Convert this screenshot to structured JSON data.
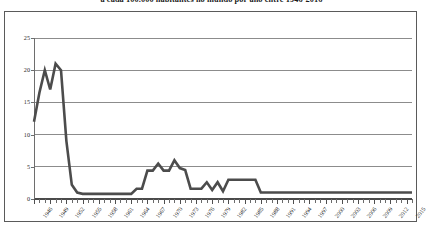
{
  "chart_data": {
    "type": "line",
    "title": "a cada 100.000 habitantes no mundo por ano entre 1946-2016",
    "xlabel": "",
    "ylabel": "",
    "ylim": [
      0,
      25
    ],
    "xlim": [
      1946,
      2016
    ],
    "yticks": [
      0,
      5,
      10,
      15,
      20,
      25
    ],
    "grid": true,
    "legend": false,
    "tick_label_step": 3,
    "xtick_labels": [
      "1946",
      "1949",
      "1952",
      "1955",
      "1958",
      "1961",
      "1964",
      "1967",
      "1970",
      "1973",
      "1976",
      "1979",
      "1982",
      "1985",
      "1988",
      "1991",
      "1994",
      "1997",
      "2000",
      "2003",
      "2006",
      "2009",
      "2012",
      "2015"
    ],
    "line_color": "#4c4c4c",
    "grid_color": "#8c8c8c",
    "x": [
      1946,
      1947,
      1948,
      1949,
      1950,
      1951,
      1952,
      1953,
      1954,
      1955,
      1956,
      1957,
      1958,
      1959,
      1960,
      1961,
      1962,
      1963,
      1964,
      1965,
      1966,
      1967,
      1968,
      1969,
      1970,
      1971,
      1972,
      1973,
      1974,
      1975,
      1976,
      1977,
      1978,
      1979,
      1980,
      1981,
      1982,
      1983,
      1984,
      1985,
      1986,
      1987,
      1988,
      1989,
      1990,
      1991,
      1992,
      1993,
      1994,
      1995,
      1996,
      1997,
      1998,
      1999,
      2000,
      2001,
      2002,
      2003,
      2004,
      2005,
      2006,
      2007,
      2008,
      2009,
      2010,
      2011,
      2012,
      2013,
      2014,
      2015,
      2016
    ],
    "values": [
      12.0,
      16.5,
      20.0,
      17.0,
      21.0,
      20.0,
      9.0,
      2.2,
      1.0,
      0.8,
      0.8,
      0.8,
      0.8,
      0.8,
      0.8,
      0.8,
      0.8,
      0.8,
      0.8,
      1.6,
      1.6,
      4.4,
      4.4,
      5.5,
      4.4,
      4.4,
      6.0,
      4.8,
      4.5,
      1.6,
      1.6,
      1.6,
      2.6,
      1.4,
      2.6,
      1.2,
      3.0,
      3.0,
      3.0,
      3.0,
      3.0,
      3.0,
      1.0,
      1.0,
      1.0,
      1.0,
      1.0,
      1.0,
      1.0,
      1.0,
      1.0,
      1.0,
      1.0,
      1.0,
      1.0,
      1.0,
      1.0,
      1.0,
      1.0,
      1.0,
      1.0,
      1.0,
      1.0,
      1.0,
      1.0,
      1.0,
      1.0,
      1.0,
      1.0,
      1.0,
      1.0
    ]
  }
}
